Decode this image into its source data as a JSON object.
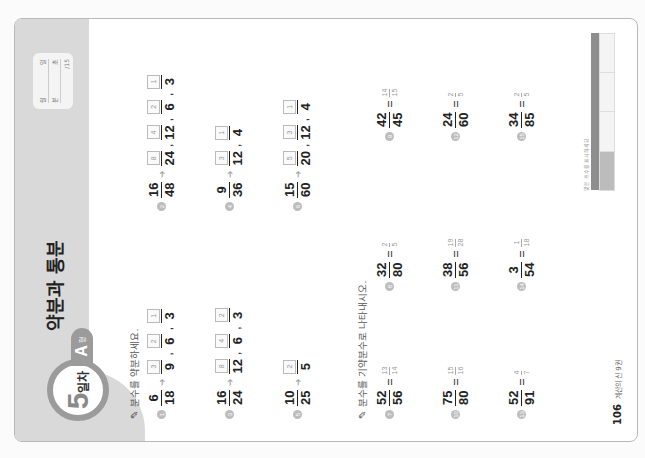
{
  "header": {
    "day_number": "5",
    "day_suffix": "일차",
    "level_letter": "A",
    "level_suffix": "형",
    "title": "약분과 통분",
    "score_box": {
      "row1": [
        "월",
        "일"
      ],
      "row2": [
        "분",
        "초"
      ],
      "total": "/15"
    }
  },
  "section1": {
    "instruction": "분수를 약분하세요.",
    "problems": [
      {
        "no": "1",
        "num": "6",
        "den": "18",
        "answers": [
          {
            "n": "3",
            "d": "9"
          },
          {
            "n": "2",
            "d": "6"
          },
          {
            "n": "1",
            "d": "3"
          }
        ]
      },
      {
        "no": "2",
        "num": "16",
        "den": "48",
        "answers": [
          {
            "n": "8",
            "d": "24"
          },
          {
            "n": "4",
            "d": "12"
          },
          {
            "n": "2",
            "d": "6"
          },
          {
            "n": "1",
            "d": "3"
          }
        ]
      },
      {
        "no": "3",
        "num": "16",
        "den": "24",
        "answers": [
          {
            "n": "8",
            "d": "12"
          },
          {
            "n": "4",
            "d": "6"
          },
          {
            "n": "2",
            "d": "3"
          }
        ]
      },
      {
        "no": "4",
        "num": "9",
        "den": "36",
        "answers": [
          {
            "n": "3",
            "d": "12"
          },
          {
            "n": "1",
            "d": "4"
          }
        ]
      },
      {
        "no": "5",
        "num": "10",
        "den": "25",
        "answers": [
          {
            "n": "2",
            "d": "5"
          }
        ]
      },
      {
        "no": "6",
        "num": "15",
        "den": "60",
        "answers": [
          {
            "n": "5",
            "d": "20"
          },
          {
            "n": "3",
            "d": "12"
          },
          {
            "n": "1",
            "d": "4"
          }
        ]
      }
    ]
  },
  "section2": {
    "instruction": "분수를 기약분수로 나타내시오.",
    "problems": [
      {
        "no": "7",
        "num": "52",
        "den": "56",
        "ans_n": "13",
        "ans_d": "14"
      },
      {
        "no": "8",
        "num": "32",
        "den": "80",
        "ans_n": "2",
        "ans_d": "5"
      },
      {
        "no": "9",
        "num": "42",
        "den": "45",
        "ans_n": "14",
        "ans_d": "15"
      },
      {
        "no": "10",
        "num": "75",
        "den": "80",
        "ans_n": "15",
        "ans_d": "16"
      },
      {
        "no": "11",
        "num": "38",
        "den": "56",
        "ans_n": "19",
        "ans_d": "28"
      },
      {
        "no": "12",
        "num": "24",
        "den": "60",
        "ans_n": "2",
        "ans_d": "5"
      },
      {
        "no": "13",
        "num": "52",
        "den": "91",
        "ans_n": "4",
        "ans_d": "7"
      },
      {
        "no": "14",
        "num": "3",
        "den": "54",
        "ans_n": "1",
        "ans_d": "18"
      },
      {
        "no": "15",
        "num": "34",
        "den": "85",
        "ans_n": "2",
        "ans_d": "5"
      }
    ]
  },
  "footer": {
    "page_number": "106",
    "book_name": "계산의 신 9권",
    "legend_caption": "맞은 개수를 표시하세요."
  },
  "colors": {
    "header_band": "#d9d9d9",
    "badge_ring": "#9b9b9b",
    "answer_hint": "#999999"
  }
}
